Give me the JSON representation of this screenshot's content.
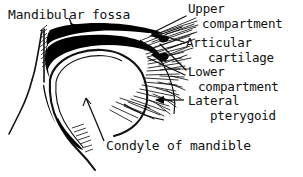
{
  "figure": {
    "title_visible": false,
    "background_color": "#ffffff",
    "ink_color": "#111111",
    "width": 303,
    "height": 177
  },
  "labels": [
    {
      "id": "mandibular-fossa",
      "text": "Mandibular fossa",
      "lines": [
        "Mandibular fossa"
      ],
      "x": 8,
      "y": 8,
      "size": "md",
      "pointer": "arrow-down-right"
    },
    {
      "id": "upper-compartment",
      "text": "Upper compartment",
      "lines": [
        "Upper",
        "compartment"
      ],
      "line1": "Upper",
      "line2": "compartment",
      "x": 188,
      "y": 3,
      "indent": 14,
      "size": "sm",
      "pointer": "leader-line"
    },
    {
      "id": "articular-cartilage",
      "text": "Articular cartilage",
      "lines": [
        "Articular",
        "cartilage"
      ],
      "line1": "Articular",
      "line2": "cartilage",
      "x": 186,
      "y": 37,
      "indent": 22,
      "size": "sm",
      "pointer": "leader-line"
    },
    {
      "id": "lower-compartment",
      "text": "Lower compartment",
      "lines": [
        "Lower",
        "compartment"
      ],
      "line1": "Lower",
      "line2": "compartment",
      "x": 188,
      "y": 66,
      "indent": 10,
      "size": "sm",
      "pointer": "leader-line"
    },
    {
      "id": "lateral-pterygoid",
      "text": "Lateral pterygoid",
      "lines": [
        "Lateral",
        "pterygoid"
      ],
      "line1": "Lateral",
      "line2": "pterygoid",
      "x": 188,
      "y": 95,
      "indent": 22,
      "size": "sm",
      "pointer": "arrow-left"
    },
    {
      "id": "condyle-of-mandible",
      "text": "Condyle of mandible",
      "lines": [
        "Condyle of mandible"
      ],
      "x": 106,
      "y": 139,
      "size": "md",
      "pointer": "leader-line"
    }
  ],
  "anatomy_parts": [
    {
      "id": "articular-disc",
      "label": "articular disc (black band)",
      "fill": "#000000"
    },
    {
      "id": "mandibular-fossa-bone",
      "label": "mandibular fossa of temporal bone",
      "fill": "#ffffff"
    },
    {
      "id": "condyle",
      "label": "condyle of mandible (condylar head)",
      "fill": "#ffffff"
    },
    {
      "id": "lateral-pterygoid-muscle",
      "label": "lateral pterygoid muscle (hatched fibers)",
      "fill": "#ffffff"
    },
    {
      "id": "upper-joint-space",
      "label": "upper compartment / superior joint cavity",
      "fill": "#ffffff"
    },
    {
      "id": "lower-joint-space",
      "label": "lower compartment / inferior joint cavity",
      "fill": "#ffffff"
    }
  ]
}
